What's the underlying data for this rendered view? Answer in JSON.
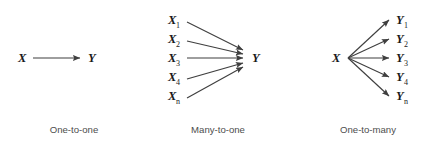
{
  "figure": {
    "background_color": "#ffffff",
    "stroke_color": "#3f3f3f",
    "label_color": "#1a1a1a",
    "caption_color": "#4d4d4d",
    "width": 430,
    "height": 146
  },
  "panels": [
    {
      "id": "one-to-one",
      "caption": "One-to-one",
      "caption_x": 74,
      "caption_y": 133,
      "sources": [
        {
          "base": "X",
          "sub": "",
          "x": 18,
          "y": 62
        }
      ],
      "targets": [
        {
          "base": "Y",
          "sub": "",
          "x": 88,
          "y": 62
        }
      ],
      "edges": [
        {
          "x1": 33,
          "y1": 58,
          "x2": 80,
          "y2": 58
        }
      ]
    },
    {
      "id": "many-to-one",
      "caption": "Many-to-one",
      "caption_x": 218,
      "caption_y": 133,
      "sources": [
        {
          "base": "X",
          "sub": "1",
          "x": 168,
          "y": 24
        },
        {
          "base": "X",
          "sub": "2",
          "x": 168,
          "y": 43
        },
        {
          "base": "X",
          "sub": "3",
          "x": 168,
          "y": 62
        },
        {
          "base": "X",
          "sub": "4",
          "x": 168,
          "y": 81
        },
        {
          "base": "X",
          "sub": "n",
          "x": 168,
          "y": 100
        }
      ],
      "targets": [
        {
          "base": "Y",
          "sub": "",
          "x": 252,
          "y": 62
        }
      ],
      "edges": [
        {
          "x1": 187,
          "y1": 22,
          "x2": 243,
          "y2": 50
        },
        {
          "x1": 187,
          "y1": 41,
          "x2": 243,
          "y2": 54
        },
        {
          "x1": 187,
          "y1": 58,
          "x2": 243,
          "y2": 58
        },
        {
          "x1": 187,
          "y1": 79,
          "x2": 243,
          "y2": 63
        },
        {
          "x1": 187,
          "y1": 98,
          "x2": 243,
          "y2": 67
        }
      ]
    },
    {
      "id": "one-to-many",
      "caption": "One-to-many",
      "caption_x": 368,
      "caption_y": 133,
      "sources": [
        {
          "base": "X",
          "sub": "",
          "x": 332,
          "y": 62
        }
      ],
      "targets": [
        {
          "base": "Y",
          "sub": "1",
          "x": 396,
          "y": 24
        },
        {
          "base": "Y",
          "sub": "2",
          "x": 396,
          "y": 43
        },
        {
          "base": "Y",
          "sub": "3",
          "x": 396,
          "y": 62
        },
        {
          "base": "Y",
          "sub": "4",
          "x": 396,
          "y": 81
        },
        {
          "base": "Y",
          "sub": "n",
          "x": 396,
          "y": 100
        }
      ],
      "edges": [
        {
          "x1": 348,
          "y1": 58,
          "x2": 389,
          "y2": 20
        },
        {
          "x1": 348,
          "y1": 58,
          "x2": 389,
          "y2": 39
        },
        {
          "x1": 348,
          "y1": 58,
          "x2": 389,
          "y2": 58
        },
        {
          "x1": 348,
          "y1": 58,
          "x2": 389,
          "y2": 77
        },
        {
          "x1": 348,
          "y1": 58,
          "x2": 389,
          "y2": 96
        }
      ]
    }
  ]
}
